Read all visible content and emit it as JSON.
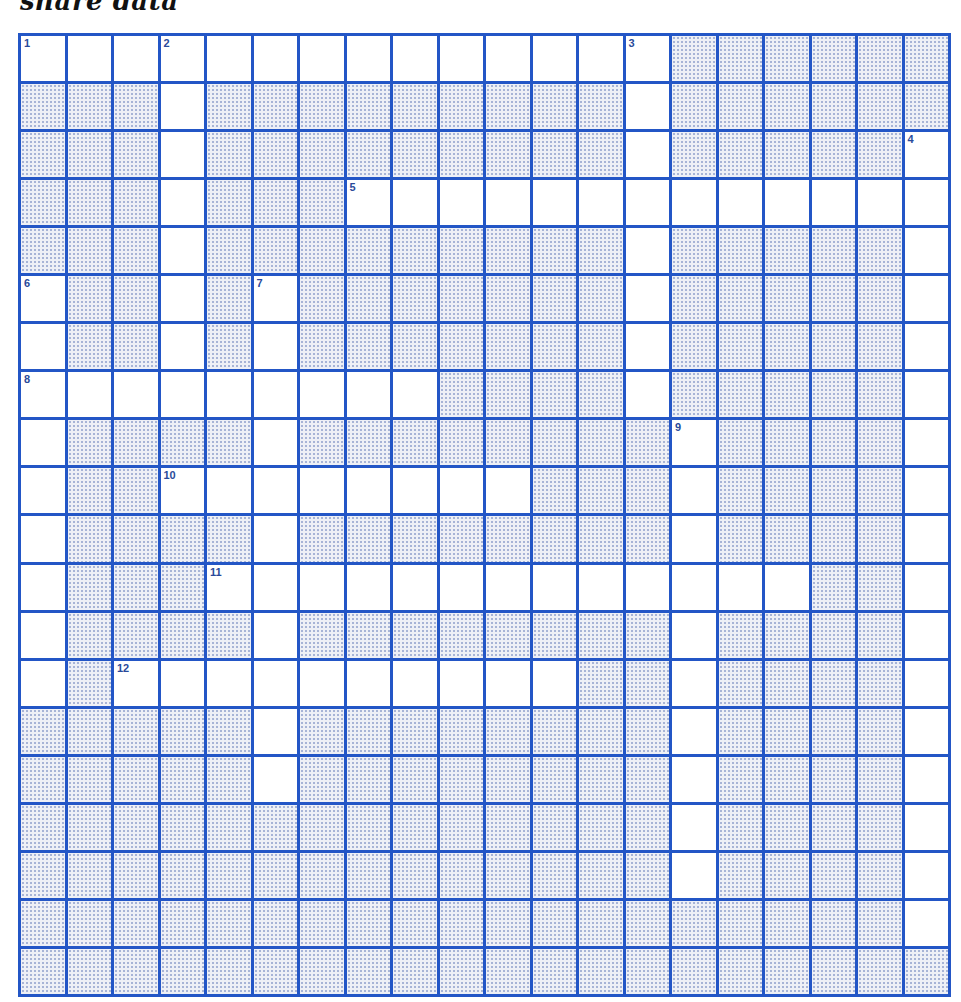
{
  "title": "share data",
  "colors": {
    "grid_line": "#2356c6",
    "open_cell": "#ffffff",
    "block_cell": "#eef0f6",
    "number": "#2a4a9a"
  },
  "grid": {
    "rows": 20,
    "cols": 20,
    "layout": [
      "OOOOOOOOOOOOOO######",
      "###O#########O######",
      "###O#########O#####O",
      "###O###OOOOOOOOOOOOO",
      "###O#########O#####O",
      "O##O#O#######O#####O",
      "O##O#O#######O#####O",
      "OOOOOOOOO####O#####O",
      "O####O########O####O",
      "O##OOOOOOOO###O####O",
      "O####O########O####O",
      "O###OOOOOOOOOOOOO##O",
      "O####O########O####O",
      "O#OOOOOOOOOO##O####O",
      "#####O########O####O",
      "#####O########O####O",
      "##############O####O",
      "##############O####O",
      "###################O",
      "####################"
    ],
    "numbers": [
      {
        "n": "1",
        "r": 0,
        "c": 0
      },
      {
        "n": "2",
        "r": 0,
        "c": 3
      },
      {
        "n": "3",
        "r": 0,
        "c": 13
      },
      {
        "n": "4",
        "r": 2,
        "c": 19
      },
      {
        "n": "5",
        "r": 3,
        "c": 7
      },
      {
        "n": "6",
        "r": 5,
        "c": 0
      },
      {
        "n": "7",
        "r": 5,
        "c": 5
      },
      {
        "n": "8",
        "r": 7,
        "c": 0
      },
      {
        "n": "9",
        "r": 8,
        "c": 14
      },
      {
        "n": "10",
        "r": 9,
        "c": 3
      },
      {
        "n": "11",
        "r": 11,
        "c": 4
      },
      {
        "n": "12",
        "r": 13,
        "c": 2
      }
    ]
  },
  "entries": {
    "across": [
      {
        "n": "1",
        "length": 14
      },
      {
        "n": "5",
        "length": 13
      },
      {
        "n": "8",
        "length": 9
      },
      {
        "n": "10",
        "length": 8
      },
      {
        "n": "11",
        "length": 13
      },
      {
        "n": "12",
        "length": 10
      }
    ],
    "down": [
      {
        "n": "2",
        "length": 8
      },
      {
        "n": "3",
        "length": 8
      },
      {
        "n": "4",
        "length": 17
      },
      {
        "n": "6",
        "length": 9
      },
      {
        "n": "7",
        "length": 11
      },
      {
        "n": "9",
        "length": 10
      }
    ]
  }
}
